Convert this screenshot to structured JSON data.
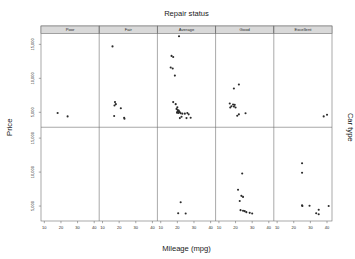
{
  "chart_data": {
    "type": "scatter",
    "title": "Repair status",
    "xlabel": "Mileage (mpg)",
    "ylabel": "Price",
    "right_label": "Car type",
    "grid": false,
    "legend": "none",
    "xlim": [
      8,
      43
    ],
    "ylim": [
      2800,
      16600
    ],
    "xticks": [
      10,
      20,
      30,
      40
    ],
    "xticklabels": [
      "10",
      "20",
      "30",
      "40"
    ],
    "yticks_top": [
      15000,
      10000,
      5000
    ],
    "yticklabels_top": [
      "15,000",
      "10,000",
      "5,000"
    ],
    "yticks_bottom": [
      15000,
      10000,
      5000
    ],
    "yticklabels_bottom": [
      "15,000",
      "10,000",
      "5,000"
    ],
    "col_variable": "Repair status",
    "row_variable": "Car type",
    "columns": [
      "Poor",
      "Fair",
      "Average",
      "Good",
      "Excellent"
    ],
    "rows": [
      "row-1",
      "row-2"
    ],
    "panels": [
      {
        "column": "Poor",
        "row": 0,
        "points": [
          [
            18.0,
            4900
          ],
          [
            24.0,
            4400
          ]
        ]
      },
      {
        "column": "Fair",
        "row": 0,
        "points": [
          [
            16.0,
            14700
          ],
          [
            17.5,
            6500
          ],
          [
            18.0,
            6200
          ],
          [
            17.2,
            6000
          ],
          [
            21.0,
            5600
          ],
          [
            17.0,
            4450
          ],
          [
            23.0,
            4200
          ],
          [
            23.2,
            4050
          ]
        ]
      },
      {
        "column": "Average",
        "row": 0,
        "points": [
          [
            21.0,
            16200
          ],
          [
            16.5,
            13300
          ],
          [
            17.5,
            13150
          ],
          [
            16.0,
            11600
          ],
          [
            17.2,
            11450
          ],
          [
            18.5,
            10400
          ],
          [
            17.5,
            6500
          ],
          [
            19.0,
            6200
          ],
          [
            20.0,
            5750
          ],
          [
            19.5,
            5500
          ],
          [
            20.2,
            5350
          ],
          [
            20.8,
            5250
          ],
          [
            20.5,
            5150
          ],
          [
            21.0,
            5100
          ],
          [
            20.0,
            5050
          ],
          [
            21.5,
            5000
          ],
          [
            19.8,
            4950
          ],
          [
            20.6,
            4900
          ],
          [
            22.0,
            4850
          ],
          [
            23.0,
            4800
          ],
          [
            24.5,
            4800
          ],
          [
            26.0,
            4900
          ],
          [
            26.8,
            4700
          ],
          [
            22.5,
            4350
          ],
          [
            21.5,
            4150
          ],
          [
            25.5,
            4150
          ],
          [
            28.0,
            4200
          ]
        ]
      },
      {
        "column": "Good",
        "row": 0,
        "points": [
          [
            22.0,
            9100
          ],
          [
            19.0,
            8500
          ],
          [
            16.5,
            6300
          ],
          [
            18.5,
            6150
          ],
          [
            19.5,
            6100
          ],
          [
            17.5,
            5900
          ],
          [
            19.0,
            5850
          ],
          [
            16.8,
            5700
          ],
          [
            20.0,
            5700
          ],
          [
            22.0,
            4700
          ],
          [
            26.0,
            4850
          ],
          [
            21.0,
            4500
          ]
        ]
      },
      {
        "column": "Excellent",
        "row": 0,
        "points": [
          [
            38.0,
            4400
          ],
          [
            40.0,
            4650
          ]
        ]
      },
      {
        "column": "Poor",
        "row": 1,
        "points": []
      },
      {
        "column": "Fair",
        "row": 1,
        "points": []
      },
      {
        "column": "Average",
        "row": 1,
        "points": [
          [
            22.0,
            5550
          ],
          [
            20.5,
            3950
          ],
          [
            25.0,
            3900
          ]
        ]
      },
      {
        "column": "Good",
        "row": 1,
        "points": [
          [
            24.0,
            9800
          ],
          [
            21.5,
            7400
          ],
          [
            23.5,
            6500
          ],
          [
            24.5,
            6350
          ],
          [
            22.5,
            5750
          ],
          [
            23.0,
            4400
          ],
          [
            24.5,
            4300
          ],
          [
            25.5,
            4250
          ],
          [
            26.5,
            4100
          ],
          [
            28.5,
            4000
          ],
          [
            30.0,
            3900
          ]
        ]
      },
      {
        "column": "Excellent",
        "row": 1,
        "points": [
          [
            25.0,
            11300
          ],
          [
            25.0,
            9900
          ],
          [
            25.0,
            5100
          ],
          [
            25.2,
            5000
          ],
          [
            29.5,
            5050
          ],
          [
            35.0,
            4450
          ],
          [
            33.5,
            3950
          ],
          [
            35.0,
            3800
          ],
          [
            41.0,
            5000
          ]
        ]
      }
    ]
  },
  "figure": {
    "title": "Repair status",
    "xaxis_title": "Mileage (mpg)",
    "yaxis_title": "Price",
    "right_axis_title": "Car type",
    "strip_labels": [
      "Poor",
      "Fair",
      "Average",
      "Good",
      "Excellent"
    ],
    "xtick_labels": [
      "10",
      "20",
      "30",
      "40"
    ],
    "ytick_labels_top": [
      "15,000",
      "10,000",
      "5,000"
    ],
    "ytick_labels_bottom": [
      "15,000",
      "10,000",
      "5,000"
    ],
    "colors": {
      "point": "#2b2b2b",
      "frame": "#6e6e6e",
      "strip_fill": "#d9d9d9",
      "background": "#ffffff",
      "text": "#1a1a1a"
    }
  }
}
